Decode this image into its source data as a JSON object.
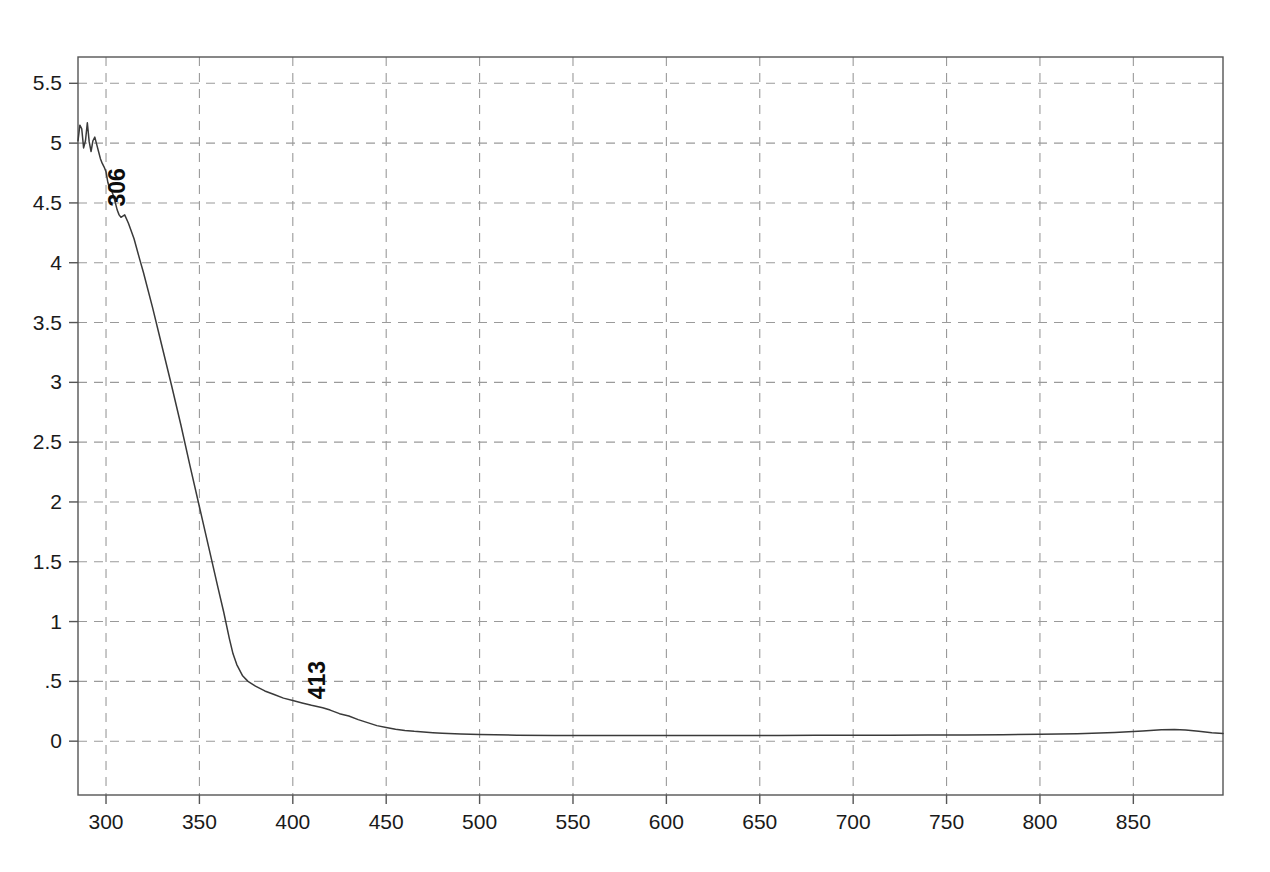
{
  "chart_data": {
    "type": "line",
    "title": "",
    "subtitle": "",
    "xlabel": "",
    "ylabel": "",
    "xlim": [
      285,
      898
    ],
    "ylim": [
      -0.45,
      5.72
    ],
    "grid": true,
    "legend": "none",
    "line_color": "#3a3a3a",
    "grid_color": "#9a9a9a",
    "axis_color": "#555555",
    "background": "#ffffff",
    "x_ticks": [
      300,
      350,
      400,
      450,
      500,
      550,
      600,
      650,
      700,
      750,
      800,
      850
    ],
    "x_tick_labels": [
      "300",
      "350",
      "400",
      "450",
      "500",
      "550",
      "600",
      "650",
      "700",
      "750",
      "800",
      "850"
    ],
    "y_ticks": [
      0,
      0.5,
      1,
      1.5,
      2,
      2.5,
      3,
      3.5,
      4,
      4.5,
      5,
      5.5
    ],
    "y_tick_labels": [
      "0",
      ".5",
      "1",
      "1.5",
      "2",
      "2.5",
      "3",
      "3.5",
      "4",
      "4.5",
      "5",
      "5.5"
    ],
    "annotations": [
      {
        "label": "306",
        "x": 306,
        "y": 4.42,
        "rotation": -90
      },
      {
        "label": "413",
        "x": 413,
        "y": 0.3,
        "rotation": -90
      }
    ],
    "series": [
      {
        "name": "absorbance",
        "x": [
          285,
          286,
          287,
          288,
          289,
          290,
          291,
          292,
          293,
          294,
          295,
          296,
          297,
          298,
          299,
          300,
          301,
          302,
          303,
          304,
          305,
          306,
          307,
          308,
          310,
          312,
          315,
          318,
          320,
          325,
          330,
          335,
          340,
          345,
          350,
          355,
          360,
          363,
          366,
          368,
          370,
          373,
          376,
          380,
          385,
          390,
          395,
          400,
          405,
          410,
          413,
          416,
          420,
          425,
          430,
          435,
          440,
          445,
          450,
          455,
          460,
          465,
          470,
          475,
          480,
          490,
          500,
          520,
          540,
          560,
          580,
          600,
          620,
          640,
          660,
          680,
          700,
          720,
          740,
          760,
          780,
          800,
          820,
          840,
          855,
          865,
          872,
          878,
          885,
          892,
          898
        ],
        "y": [
          5.02,
          5.15,
          5.12,
          4.96,
          5.02,
          5.17,
          5.01,
          4.93,
          5.02,
          5.05,
          4.99,
          4.93,
          4.87,
          4.83,
          4.8,
          4.76,
          4.67,
          4.62,
          4.6,
          4.56,
          4.5,
          4.44,
          4.4,
          4.38,
          4.4,
          4.33,
          4.2,
          4.03,
          3.92,
          3.62,
          3.3,
          2.98,
          2.65,
          2.3,
          1.96,
          1.62,
          1.28,
          1.08,
          0.86,
          0.73,
          0.64,
          0.55,
          0.5,
          0.46,
          0.42,
          0.39,
          0.36,
          0.34,
          0.32,
          0.3,
          0.29,
          0.28,
          0.26,
          0.23,
          0.21,
          0.18,
          0.155,
          0.13,
          0.115,
          0.1,
          0.09,
          0.082,
          0.076,
          0.071,
          0.067,
          0.06,
          0.055,
          0.05,
          0.048,
          0.047,
          0.047,
          0.047,
          0.047,
          0.048,
          0.048,
          0.049,
          0.05,
          0.05,
          0.051,
          0.052,
          0.054,
          0.057,
          0.062,
          0.073,
          0.085,
          0.095,
          0.098,
          0.093,
          0.082,
          0.07,
          0.065
        ]
      }
    ]
  }
}
